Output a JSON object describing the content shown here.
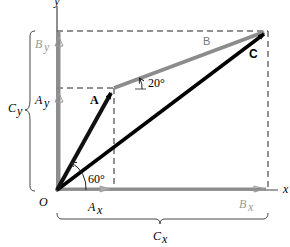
{
  "diagram": {
    "axes": {
      "x_label": "x",
      "y_label": "y",
      "origin_label": "O"
    },
    "vectors": [
      {
        "name": "A",
        "label": "A",
        "angle_label": "60°",
        "from": "O",
        "color": "#111111"
      },
      {
        "name": "B",
        "label": "B",
        "angle_label": "20°",
        "from": "A tip",
        "color": "#8c8c8c"
      },
      {
        "name": "C",
        "label": "C",
        "from": "O",
        "color": "#000000"
      }
    ],
    "components": {
      "Ax": {
        "label": "A",
        "sub": "x"
      },
      "Ay": {
        "label": "A",
        "sub": "y"
      },
      "Bx": {
        "label": "B",
        "sub": "x"
      },
      "By": {
        "label": "B",
        "sub": "y"
      },
      "Cx": {
        "label": "C",
        "sub": "x"
      },
      "Cy": {
        "label": "C",
        "sub": "y"
      }
    },
    "colors": {
      "vector_A": "#111111",
      "vector_B": "#8c8c8c",
      "vector_C": "#000000",
      "axis": "#333333",
      "component_gray": "#999999",
      "dashed": "#222222"
    }
  }
}
